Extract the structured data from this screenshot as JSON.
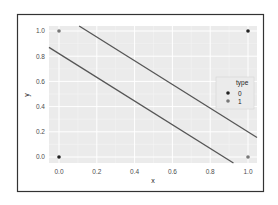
{
  "chart_data": {
    "type": "scatter",
    "title": "",
    "xlabel": "x",
    "ylabel": "y",
    "xlim": [
      -0.05,
      1.05
    ],
    "ylim": [
      -0.05,
      1.05
    ],
    "x_ticks": [
      0.0,
      0.2,
      0.4,
      0.6,
      0.8,
      1.0
    ],
    "x_tick_labels": [
      "0.0",
      "0.2",
      "0.4",
      "0.6",
      "0.8",
      "1.0"
    ],
    "y_ticks": [
      0.0,
      0.2,
      0.4,
      0.6,
      0.8,
      1.0
    ],
    "y_tick_labels": [
      "0.0",
      "0.2",
      "0.4",
      "0.6",
      "0.8",
      "1.0"
    ],
    "grid": true,
    "legend": {
      "title": "type",
      "position": "right",
      "entries": [
        {
          "label": "0",
          "color": "#222222"
        },
        {
          "label": "1",
          "color": "#777777"
        }
      ]
    },
    "series": [
      {
        "name": "0",
        "color": "#222222",
        "points": [
          {
            "x": 0,
            "y": 0
          },
          {
            "x": 1,
            "y": 1
          }
        ]
      },
      {
        "name": "1",
        "color": "#777777",
        "points": [
          {
            "x": 0,
            "y": 1
          },
          {
            "x": 1,
            "y": 0
          }
        ]
      }
    ],
    "lines": [
      {
        "name": "upper-line",
        "intercept": 1.14,
        "slope": -0.94,
        "color": "#555555"
      },
      {
        "name": "lower-line",
        "intercept": 0.82,
        "slope": -0.94,
        "color": "#555555"
      }
    ]
  },
  "colors": {
    "panel_bg": "#ebebeb",
    "grid_major": "#ffffff",
    "grid_minor": "#f4f4f4",
    "frame": "#333333"
  }
}
